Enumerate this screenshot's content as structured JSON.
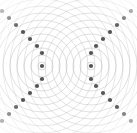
{
  "figure": {
    "width": 137,
    "height": 133,
    "background_color": "#ffffff"
  },
  "chart_data": {
    "type": "scatter",
    "subtitle": "",
    "xlabel": "",
    "ylabel": "",
    "xlim": [
      0,
      137
    ],
    "ylim": [
      0,
      133
    ],
    "grid": false,
    "legend_position": "none",
    "annotations": [],
    "wavefronts": {
      "description": "Concentric circular wavefronts radiating from each of two point sources",
      "stroke_color": "#b9b9b9",
      "stroke_width": 0.55,
      "wavelength_px": 7.0,
      "ring_count_per_source": 26,
      "first_ring_radius_px": 4.0,
      "fade_edge": true
    },
    "series": [
      {
        "name": "source-1",
        "marker": "circle",
        "color": "#555555",
        "radius_px": 2.1,
        "x": [
          42
        ],
        "y": [
          66
        ]
      },
      {
        "name": "source-2",
        "marker": "circle",
        "color": "#555555",
        "radius_px": 2.1,
        "x": [
          91
        ],
        "y": [
          66
        ]
      },
      {
        "name": "nodal-points-upper-left-arm",
        "marker": "circle",
        "color": "#555555",
        "radius_px": 2.1,
        "x": [
          42,
          37,
          30,
          23,
          16,
          9,
          2
        ],
        "y": [
          53,
          46,
          39,
          32,
          25,
          18,
          11
        ]
      },
      {
        "name": "nodal-points-lower-left-arm",
        "marker": "circle",
        "color": "#555555",
        "radius_px": 2.1,
        "x": [
          42,
          37,
          30,
          23,
          16,
          9,
          2
        ],
        "y": [
          79,
          86,
          93,
          100,
          107,
          114,
          121
        ]
      },
      {
        "name": "nodal-points-upper-right-arm",
        "marker": "circle",
        "color": "#555555",
        "radius_px": 2.1,
        "x": [
          91,
          96,
          103,
          110,
          117,
          124,
          131
        ],
        "y": [
          53,
          46,
          39,
          32,
          25,
          18,
          11
        ]
      },
      {
        "name": "nodal-points-lower-right-arm",
        "marker": "circle",
        "color": "#555555",
        "radius_px": 2.1,
        "x": [
          91,
          96,
          103,
          110,
          117,
          124,
          131
        ],
        "y": [
          79,
          86,
          93,
          100,
          107,
          114,
          121
        ]
      }
    ],
    "sources": [
      {
        "label": "S1",
        "x": 42,
        "y": 66
      },
      {
        "label": "S2",
        "x": 91,
        "y": 66
      }
    ],
    "colors": {
      "marker": "#555555",
      "wavefront": "#b9b9b9",
      "background": "#ffffff"
    }
  }
}
